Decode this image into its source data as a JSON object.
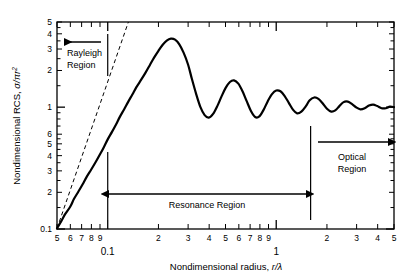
{
  "chart_data": {
    "type": "line",
    "title": "",
    "xlabel": "Nondimensional radius, r/λ",
    "ylabel": "Nondimensional RCS, σ/πr²",
    "xscale": "log",
    "yscale": "log",
    "xlim": [
      0.05,
      5.0
    ],
    "ylim": [
      0.1,
      5.0
    ],
    "grid": false,
    "legend": null,
    "x_tick_labels": [
      "5",
      "6",
      "7",
      "8",
      "9",
      "0.1",
      "2",
      "3",
      "4",
      "5",
      "6",
      "7",
      "8",
      "9",
      "1",
      "2",
      "3",
      "4",
      "5"
    ],
    "x_tick_values": [
      0.05,
      0.06,
      0.07,
      0.08,
      0.09,
      0.1,
      0.2,
      0.3,
      0.4,
      0.5,
      0.6,
      0.7,
      0.8,
      0.9,
      1.0,
      2.0,
      3.0,
      4.0,
      5.0
    ],
    "x_decade_labels": [
      {
        "text": "0.1",
        "value": 0.1
      },
      {
        "text": "1",
        "value": 1.0
      }
    ],
    "y_tick_labels": [
      "5",
      "4",
      "3",
      "2",
      "1",
      "6",
      "5",
      "4",
      "3",
      "2",
      "0.1"
    ],
    "y_tick_values": [
      5.0,
      4.0,
      3.0,
      2.0,
      1.0,
      0.6,
      0.5,
      0.4,
      0.3,
      0.2,
      0.1
    ],
    "series": [
      {
        "name": "Mie RCS of sphere",
        "style": "solid",
        "color": "#000000",
        "linewidth": 2.2,
        "description": "Normalized radar cross section of a conducting sphere versus radius over wavelength"
      },
      {
        "name": "Rayleigh asymptote",
        "style": "dashed",
        "color": "#000000",
        "linewidth": 1.0,
        "description": "Rayleigh region fourth-power asymptote extended past its validity"
      }
    ],
    "annotations": [
      {
        "name": "rayleigh-region",
        "label_line1": "Rayleigh",
        "label_line2": "Region",
        "arrow": "left"
      },
      {
        "name": "resonance-region",
        "label_line1": "Resonance Region",
        "label_line2": "",
        "arrow": "double"
      },
      {
        "name": "optical-region",
        "label_line1": "Optical",
        "label_line2": "Region",
        "arrow": "right"
      }
    ],
    "region_boundaries": [
      0.1,
      1.6
    ],
    "curve_points_x": [
      0.05,
      0.053,
      0.056,
      0.06,
      0.063,
      0.067,
      0.071,
      0.075,
      0.08,
      0.085,
      0.09,
      0.095,
      0.1,
      0.106,
      0.112,
      0.118,
      0.125,
      0.132,
      0.14,
      0.148,
      0.158,
      0.168,
      0.178,
      0.188,
      0.2,
      0.212,
      0.224,
      0.237,
      0.251,
      0.266,
      0.282,
      0.3,
      0.316,
      0.335,
      0.355,
      0.376,
      0.398,
      0.422,
      0.447,
      0.473,
      0.501,
      0.531,
      0.562,
      0.596,
      0.631,
      0.668,
      0.708,
      0.75,
      0.794,
      0.841,
      0.891,
      0.944,
      1.0,
      1.06,
      1.12,
      1.19,
      1.26,
      1.33,
      1.41,
      1.5,
      1.58,
      1.68,
      1.78,
      1.88,
      2.0,
      2.12,
      2.24,
      2.37,
      2.51,
      2.66,
      2.82,
      3.0,
      3.16,
      3.35,
      3.55,
      3.76,
      3.98,
      4.22,
      4.47,
      4.73,
      5.0
    ],
    "curve_points_y": [
      0.101,
      0.116,
      0.133,
      0.153,
      0.176,
      0.203,
      0.233,
      0.268,
      0.309,
      0.356,
      0.41,
      0.472,
      0.544,
      0.627,
      0.722,
      0.832,
      0.958,
      1.1,
      1.27,
      1.46,
      1.68,
      1.93,
      2.22,
      2.54,
      2.9,
      3.25,
      3.52,
      3.65,
      3.58,
      3.28,
      2.8,
      2.23,
      1.7,
      1.28,
      1.0,
      0.86,
      0.82,
      0.88,
      1.02,
      1.22,
      1.44,
      1.61,
      1.66,
      1.56,
      1.35,
      1.12,
      0.93,
      0.83,
      0.84,
      0.95,
      1.12,
      1.28,
      1.37,
      1.35,
      1.24,
      1.08,
      0.95,
      0.89,
      0.92,
      1.02,
      1.14,
      1.2,
      1.17,
      1.08,
      0.97,
      0.92,
      0.94,
      1.02,
      1.1,
      1.11,
      1.06,
      0.99,
      0.96,
      0.98,
      1.03,
      1.05,
      1.02,
      0.98,
      0.98,
      1.01,
      1.0
    ]
  },
  "axes": {
    "x_title": "Nondimensional radius, ",
    "x_title_math": "r/λ",
    "y_title": "Nondimensional RCS, ",
    "y_title_math": "σ/πr",
    "y_title_exp": "2"
  },
  "regions": {
    "rayleigh": {
      "line1": "Rayleigh",
      "line2": "Region"
    },
    "resonance": {
      "label": "Resonance Region"
    },
    "optical": {
      "line1": "Optical",
      "line2": "Region"
    }
  },
  "x_ticks": [
    {
      "label": "5",
      "value": 0.05,
      "major": false
    },
    {
      "label": "6",
      "value": 0.06,
      "major": false
    },
    {
      "label": "7",
      "value": 0.07,
      "major": false
    },
    {
      "label": "8",
      "value": 0.08,
      "major": false
    },
    {
      "label": "9",
      "value": 0.09,
      "major": false
    },
    {
      "label": "",
      "value": 0.1,
      "major": true
    },
    {
      "label": "2",
      "value": 0.2,
      "major": false
    },
    {
      "label": "3",
      "value": 0.3,
      "major": false
    },
    {
      "label": "4",
      "value": 0.4,
      "major": false
    },
    {
      "label": "5",
      "value": 0.5,
      "major": false
    },
    {
      "label": "6",
      "value": 0.6,
      "major": false
    },
    {
      "label": "7",
      "value": 0.7,
      "major": false
    },
    {
      "label": "8",
      "value": 0.8,
      "major": false
    },
    {
      "label": "9",
      "value": 0.9,
      "major": false
    },
    {
      "label": "",
      "value": 1.0,
      "major": true
    },
    {
      "label": "2",
      "value": 2.0,
      "major": false
    },
    {
      "label": "3",
      "value": 3.0,
      "major": false
    },
    {
      "label": "4",
      "value": 4.0,
      "major": false
    },
    {
      "label": "5",
      "value": 5.0,
      "major": false
    }
  ],
  "x_decades": [
    {
      "label": "0.1",
      "value": 0.1
    },
    {
      "label": "1",
      "value": 1.0
    }
  ],
  "y_ticks": [
    {
      "label": "5",
      "value": 5.0
    },
    {
      "label": "4",
      "value": 4.0
    },
    {
      "label": "3",
      "value": 3.0
    },
    {
      "label": "2",
      "value": 2.0
    },
    {
      "label": "1",
      "value": 1.0
    },
    {
      "label": "6",
      "value": 0.6
    },
    {
      "label": "5",
      "value": 0.5
    },
    {
      "label": "4",
      "value": 0.4
    },
    {
      "label": "3",
      "value": 0.3
    },
    {
      "label": "2",
      "value": 0.2
    },
    {
      "label": "0.1",
      "value": 0.1
    }
  ],
  "y_minor_ticks": [
    0.7,
    0.8,
    0.9,
    1.5,
    2.5,
    3.5,
    4.5,
    0.15,
    0.25,
    0.35,
    0.45,
    0.55
  ]
}
